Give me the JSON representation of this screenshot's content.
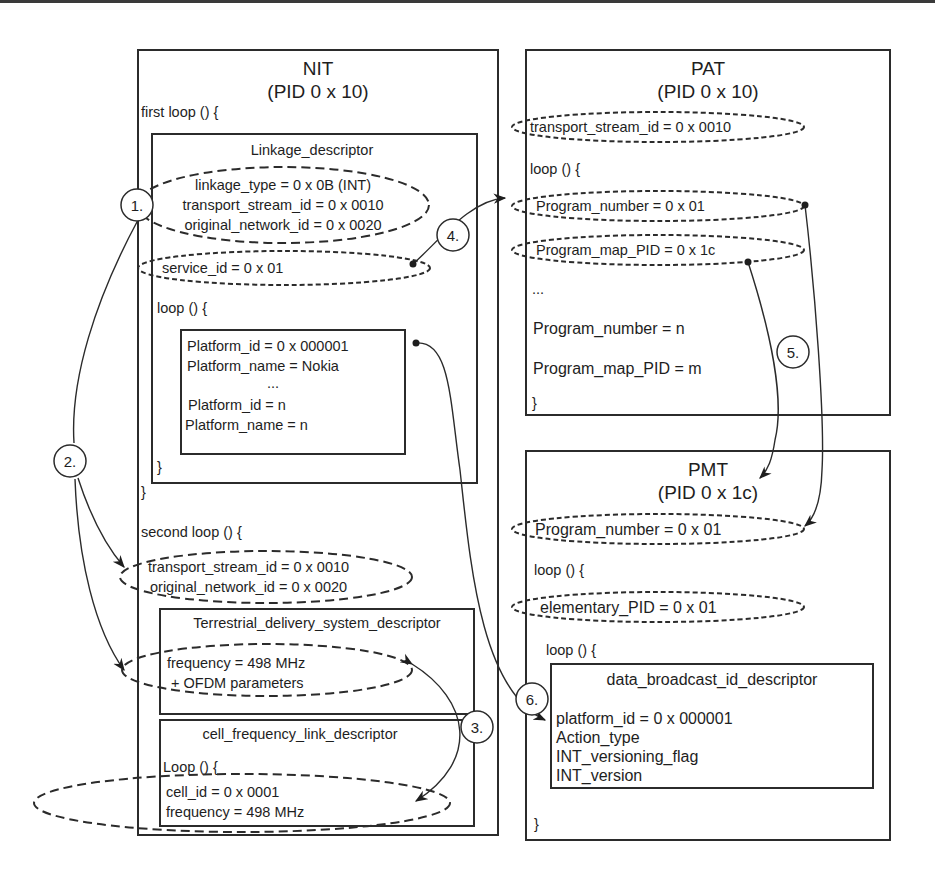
{
  "nit": {
    "title": "NIT",
    "pid": "(PID 0 x 10)",
    "first_loop": "first loop () {",
    "linkage_descriptor": {
      "title": "Linkage_descriptor",
      "fields": [
        "linkage_type = 0 x 0B (INT)",
        "transport_stream_id = 0 x 0010",
        "original_network_id = 0 x 0020"
      ],
      "service_id": "service_id = 0 x 01",
      "loop": "loop () {",
      "platform_fields": [
        "Platform_id = 0 x 000001",
        "Platform_name = Nokia",
        "...",
        "Platform_id = n",
        "Platform_name = n"
      ],
      "inner_close": "}"
    },
    "first_loop_close": "}",
    "second_loop": "second loop () {",
    "second_loop_fields": [
      "transport_stream_id = 0 x 0010",
      "original_network_id = 0 x 0020"
    ],
    "terrestrial_descriptor": {
      "title": "Terrestrial_delivery_system_descriptor",
      "fields": [
        "frequency = 498 MHz",
        "+ OFDM parameters"
      ]
    },
    "cell_frequency_descriptor": {
      "title": "cell_frequency_link_descriptor",
      "loop": "Loop () {",
      "fields": [
        "cell_id = 0 x 0001",
        "frequency = 498 MHz"
      ]
    }
  },
  "pat": {
    "title": "PAT",
    "pid": "(PID 0 x 10)",
    "transport_stream_id": "transport_stream_id = 0 x 0010",
    "loop": "loop () {",
    "program_number": "Program_number = 0 x 01",
    "program_map_pid": "Program_map_PID = 0 x 1c",
    "ellipsis": "...",
    "program_number_n": "Program_number = n",
    "program_map_pid_m": "Program_map_PID = m",
    "close": "}"
  },
  "pmt": {
    "title": "PMT",
    "pid": "(PID 0 x 1c)",
    "program_number": "Program_number = 0 x 01",
    "loop": "loop () {",
    "elementary_pid": "elementary_PID = 0 x 01",
    "inner_loop": "loop () {",
    "data_broadcast_descriptor": {
      "title": "data_broadcast_id_descriptor",
      "fields": [
        "platform_id = 0 x 000001",
        "Action_type",
        "INT_versioning_flag",
        "INT_version"
      ]
    },
    "close": "}"
  },
  "steps": [
    "1.",
    "2.",
    "3.",
    "4.",
    "5.",
    "6."
  ]
}
